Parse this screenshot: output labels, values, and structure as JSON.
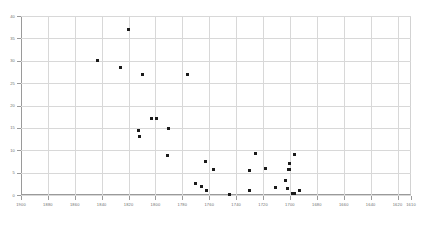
{
  "chart_data": {
    "type": "scatter",
    "title": "",
    "subtitle": "",
    "xlabel": "",
    "ylabel": "",
    "xlim": [
      1900,
      1610
    ],
    "ylim": [
      0,
      40
    ],
    "grid": true,
    "legend": null,
    "x_ticks": [
      1900,
      1880,
      1860,
      1840,
      1820,
      1800,
      1780,
      1760,
      1740,
      1720,
      1700,
      1680,
      1660,
      1640,
      1620,
      1610
    ],
    "x_tick_labels": [
      "1900",
      "1880",
      "1860",
      "1840",
      "1820",
      "1800",
      "1780",
      "1760",
      "1740",
      "1720",
      "1700",
      "1680",
      "1660",
      "1640",
      "1620",
      "1610"
    ],
    "y_ticks": [
      0,
      5,
      10,
      15,
      20,
      25,
      30,
      35,
      40
    ],
    "y_tick_labels": [
      "0",
      "5",
      "10",
      "15",
      "20",
      "25",
      "30",
      "35",
      "40"
    ],
    "marker": "square",
    "marker_color": "#1b1b1b",
    "gridline_color": "#d8d8d8",
    "axis_color": "#9a9a9a",
    "background_color": "#ffffff",
    "points": [
      {
        "x": 1820,
        "y": 37.0
      },
      {
        "x": 1843,
        "y": 30.0
      },
      {
        "x": 1826,
        "y": 28.5
      },
      {
        "x": 1810,
        "y": 27.0
      },
      {
        "x": 1776,
        "y": 27.0
      },
      {
        "x": 1803,
        "y": 17.2
      },
      {
        "x": 1799,
        "y": 17.1
      },
      {
        "x": 1790,
        "y": 14.8
      },
      {
        "x": 1813,
        "y": 14.5
      },
      {
        "x": 1812,
        "y": 13.0
      },
      {
        "x": 1791,
        "y": 8.8
      },
      {
        "x": 1763,
        "y": 7.5
      },
      {
        "x": 1757,
        "y": 5.7
      },
      {
        "x": 1730,
        "y": 5.5
      },
      {
        "x": 1718,
        "y": 5.9
      },
      {
        "x": 1700,
        "y": 5.8
      },
      {
        "x": 1726,
        "y": 9.3
      },
      {
        "x": 1697,
        "y": 9.0
      },
      {
        "x": 1700,
        "y": 7.0
      },
      {
        "x": 1701,
        "y": 5.7
      },
      {
        "x": 1703,
        "y": 3.2
      },
      {
        "x": 1770,
        "y": 2.5
      },
      {
        "x": 1766,
        "y": 1.8
      },
      {
        "x": 1762,
        "y": 0.9
      },
      {
        "x": 1745,
        "y": 0.2
      },
      {
        "x": 1730,
        "y": 1.0
      },
      {
        "x": 1711,
        "y": 1.6
      },
      {
        "x": 1702,
        "y": 1.5
      },
      {
        "x": 1698,
        "y": 0.3
      },
      {
        "x": 1697,
        "y": 0.3
      },
      {
        "x": 1693,
        "y": 0.9
      }
    ]
  }
}
